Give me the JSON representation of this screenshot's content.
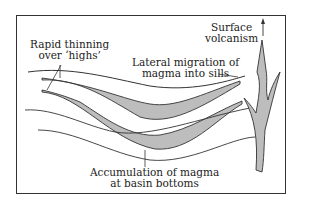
{
  "diagram": {
    "type": "geological cross-section",
    "labels": {
      "thinning_line1": "Rapid thinning",
      "thinning_line2": "over ‘highs’",
      "migration_line1": "Lateral migration of",
      "migration_line2": "magma into sills",
      "volcanism_line1": "Surface",
      "volcanism_line2": "volcanism",
      "accumulation_line1": "Accumulation of magma",
      "accumulation_line2": "at basin bottoms"
    },
    "colors": {
      "magma_fill": "#bdbdbd",
      "line": "#333333",
      "background": "#ffffff"
    }
  }
}
